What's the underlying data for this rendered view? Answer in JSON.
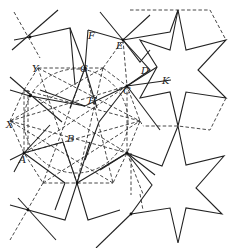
{
  "figure": {
    "labels": [
      {
        "text": "F",
        "x": 88,
        "y": 39
      },
      {
        "text": "E",
        "x": 117,
        "y": 48
      },
      {
        "text": "Y",
        "x": 34,
        "y": 71
      },
      {
        "text": "G",
        "x": 80,
        "y": 72
      },
      {
        "text": "D",
        "x": 142,
        "y": 74
      },
      {
        "text": "K",
        "x": 163,
        "y": 83
      },
      {
        "text": "H",
        "x": 90,
        "y": 104
      },
      {
        "text": "C",
        "x": 124,
        "y": 92
      },
      {
        "text": "X",
        "x": 8,
        "y": 128
      },
      {
        "text": "B",
        "x": 68,
        "y": 142
      },
      {
        "text": "A",
        "x": 19,
        "y": 162
      }
    ],
    "colors": {
      "background": "#ffffff",
      "line": "#222222"
    }
  }
}
